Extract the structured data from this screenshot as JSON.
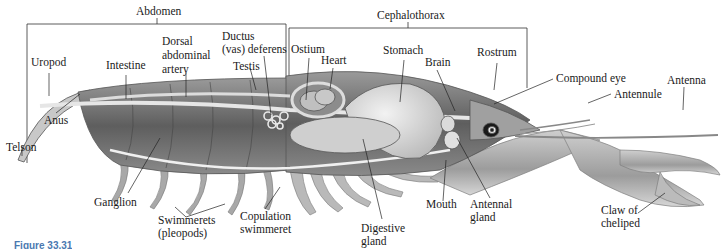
{
  "figure": {
    "caption": "Figure 33.31"
  },
  "regions": {
    "abdomen": "Abdomen",
    "cephalothorax": "Cephalothorax"
  },
  "labels": {
    "uropod": "Uropod",
    "intestine": "Intestine",
    "dorsal_abdominal_artery": "Dorsal\nabdominal\nartery",
    "ductus_deferens": "Ductus\n(vas) deferens",
    "testis": "Testis",
    "ostium": "Ostium",
    "heart": "Heart",
    "stomach": "Stomach",
    "brain": "Brain",
    "rostrum": "Rostrum",
    "compound_eye": "Compound eye",
    "antennule": "Antennule",
    "antenna": "Antenna",
    "anus": "Anus",
    "telson": "Telson",
    "ganglion": "Ganglion",
    "swimmerets": "Swimmerets\n(pleopods)",
    "copulation_swimmeret": "Copulation\nswimmeret",
    "digestive_gland": "Digestive\ngland",
    "mouth": "Mouth",
    "antennal_gland": "Antennal\ngland",
    "claw_of_cheliped": "Claw of\ncheliped"
  },
  "colors": {
    "label_text": "#1a1a1a",
    "leader_line": "#222222",
    "body_dark": "#6b6b6b",
    "body_mid": "#a5a5a5",
    "body_light": "#dcdcdc",
    "caption": "#4a78b0"
  }
}
